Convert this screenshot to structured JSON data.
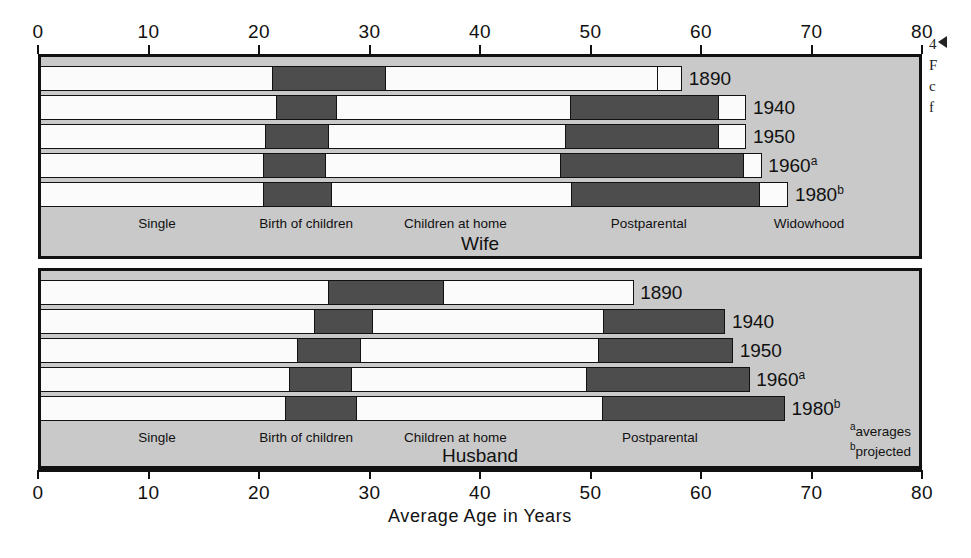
{
  "chart_data": {
    "type": "bar",
    "title": "",
    "xlabel": "Average Age in Years",
    "ylabel": "",
    "xlim": [
      0,
      80
    ],
    "xticks": [
      0,
      10,
      20,
      30,
      40,
      50,
      60,
      70,
      80
    ],
    "grid": false,
    "orientation": "horizontal",
    "stacked": true,
    "legend_position": "inline-stage-labels",
    "stages": [
      "Single",
      "Birth of children",
      "Children at home",
      "Postparental",
      "Widowhood"
    ],
    "stage_colors": {
      "Single": "#fbfbfb",
      "Birth of children": "#4d4d4d",
      "Children at home": "#fbfbfb",
      "Postparental": "#4d4d4d",
      "Widowhood": "#fbfbfb"
    },
    "panels": [
      {
        "name": "Wife",
        "title": "Wife",
        "stage_labels": [
          {
            "text": "Single",
            "x": 10.5
          },
          {
            "text": "Birth of children",
            "x": 24.0
          },
          {
            "text": "Children at home",
            "x": 37.5
          },
          {
            "text": "Postparental",
            "x": 55.0
          },
          {
            "text": "Widowhood",
            "x": 69.5
          }
        ],
        "series": [
          {
            "label": "1890",
            "label_sup": "",
            "boundaries": [
              0,
              21.0,
              31.3,
              55.9,
              55.9,
              57.9
            ],
            "segments": [
              {
                "stage": "Single",
                "start": 0,
                "end": 21.0
              },
              {
                "stage": "Birth of children",
                "start": 21.0,
                "end": 31.3
              },
              {
                "stage": "Children at home",
                "start": 31.3,
                "end": 55.9
              },
              {
                "stage": "Postparental",
                "start": 55.9,
                "end": 55.9
              },
              {
                "stage": "Widowhood",
                "start": 55.9,
                "end": 57.9
              }
            ]
          },
          {
            "label": "1940",
            "label_sup": "",
            "boundaries": [
              0,
              21.4,
              26.8,
              48.0,
              61.4,
              63.7
            ],
            "segments": [
              {
                "stage": "Single",
                "start": 0,
                "end": 21.4
              },
              {
                "stage": "Birth of children",
                "start": 21.4,
                "end": 26.8
              },
              {
                "stage": "Children at home",
                "start": 26.8,
                "end": 48.0
              },
              {
                "stage": "Postparental",
                "start": 48.0,
                "end": 61.4
              },
              {
                "stage": "Widowhood",
                "start": 61.4,
                "end": 63.7
              }
            ]
          },
          {
            "label": "1950",
            "label_sup": "",
            "boundaries": [
              0,
              20.4,
              26.1,
              47.6,
              61.4,
              63.7
            ],
            "segments": [
              {
                "stage": "Single",
                "start": 0,
                "end": 20.4
              },
              {
                "stage": "Birth of children",
                "start": 20.4,
                "end": 26.1
              },
              {
                "stage": "Children at home",
                "start": 26.1,
                "end": 47.6
              },
              {
                "stage": "Postparental",
                "start": 47.6,
                "end": 61.4
              },
              {
                "stage": "Widowhood",
                "start": 61.4,
                "end": 63.7
              }
            ]
          },
          {
            "label": "1960",
            "label_sup": "a",
            "boundaries": [
              0,
              20.2,
              25.8,
              47.1,
              63.7,
              65.1
            ],
            "segments": [
              {
                "stage": "Single",
                "start": 0,
                "end": 20.2
              },
              {
                "stage": "Birth of children",
                "start": 20.2,
                "end": 25.8
              },
              {
                "stage": "Children at home",
                "start": 25.8,
                "end": 47.1
              },
              {
                "stage": "Postparental",
                "start": 47.1,
                "end": 63.7
              },
              {
                "stage": "Widowhood",
                "start": 63.7,
                "end": 65.1
              }
            ]
          },
          {
            "label": "1980",
            "label_sup": "b",
            "boundaries": [
              0,
              20.2,
              26.4,
              48.1,
              65.1,
              67.5
            ],
            "segments": [
              {
                "stage": "Single",
                "start": 0,
                "end": 20.2
              },
              {
                "stage": "Birth of children",
                "start": 20.2,
                "end": 26.4
              },
              {
                "stage": "Children at home",
                "start": 26.4,
                "end": 48.1
              },
              {
                "stage": "Postparental",
                "start": 48.1,
                "end": 65.1
              },
              {
                "stage": "Widowhood",
                "start": 65.1,
                "end": 67.5
              }
            ]
          }
        ]
      },
      {
        "name": "Husband",
        "title": "Husband",
        "stage_labels": [
          {
            "text": "Single",
            "x": 10.5
          },
          {
            "text": "Birth of children",
            "x": 24.0
          },
          {
            "text": "Children at home",
            "x": 37.5
          },
          {
            "text": "Postparental",
            "x": 56.0
          }
        ],
        "series": [
          {
            "label": "1890",
            "label_sup": "",
            "boundaries": [
              0,
              26.1,
              36.5,
              53.5,
              53.5
            ],
            "segments": [
              {
                "stage": "Single",
                "start": 0,
                "end": 26.1
              },
              {
                "stage": "Birth of children",
                "start": 26.1,
                "end": 36.5
              },
              {
                "stage": "Children at home",
                "start": 36.5,
                "end": 53.5
              },
              {
                "stage": "Postparental",
                "start": 53.5,
                "end": 53.5
              }
            ]
          },
          {
            "label": "1940",
            "label_sup": "",
            "boundaries": [
              0,
              24.8,
              30.1,
              51.0,
              61.8
            ],
            "segments": [
              {
                "stage": "Single",
                "start": 0,
                "end": 24.8
              },
              {
                "stage": "Birth of children",
                "start": 24.8,
                "end": 30.1
              },
              {
                "stage": "Children at home",
                "start": 30.1,
                "end": 51.0
              },
              {
                "stage": "Postparental",
                "start": 51.0,
                "end": 61.8
              }
            ]
          },
          {
            "label": "1950",
            "label_sup": "",
            "boundaries": [
              0,
              23.3,
              29.0,
              50.5,
              62.5
            ],
            "segments": [
              {
                "stage": "Single",
                "start": 0,
                "end": 23.3
              },
              {
                "stage": "Birth of children",
                "start": 23.3,
                "end": 29.0
              },
              {
                "stage": "Children at home",
                "start": 29.0,
                "end": 50.5
              },
              {
                "stage": "Postparental",
                "start": 50.5,
                "end": 62.5
              }
            ]
          },
          {
            "label": "1960",
            "label_sup": "a",
            "boundaries": [
              0,
              22.6,
              28.2,
              49.5,
              64.0
            ],
            "segments": [
              {
                "stage": "Single",
                "start": 0,
                "end": 22.6
              },
              {
                "stage": "Birth of children",
                "start": 22.6,
                "end": 28.2
              },
              {
                "stage": "Children at home",
                "start": 28.2,
                "end": 49.5
              },
              {
                "stage": "Postparental",
                "start": 49.5,
                "end": 64.0
              }
            ]
          },
          {
            "label": "1980",
            "label_sup": "b",
            "boundaries": [
              0,
              22.2,
              28.6,
              50.9,
              67.2
            ],
            "segments": [
              {
                "stage": "Single",
                "start": 0,
                "end": 22.2
              },
              {
                "stage": "Birth of children",
                "start": 22.2,
                "end": 28.6
              },
              {
                "stage": "Children at home",
                "start": 28.6,
                "end": 50.9
              },
              {
                "stage": "Postparental",
                "start": 50.9,
                "end": 67.2
              }
            ]
          }
        ]
      }
    ]
  },
  "footnotes": [
    {
      "marker": "a",
      "text": "averages"
    },
    {
      "marker": "b",
      "text": "projected"
    }
  ],
  "margin_bleed": {
    "lines": [
      "4",
      "F",
      "c",
      "f"
    ]
  }
}
